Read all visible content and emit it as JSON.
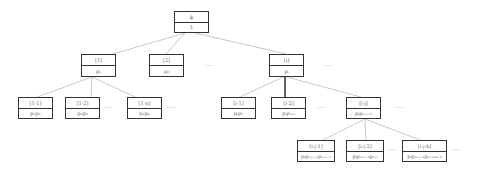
{
  "diagram": {
    "type": "tree",
    "nodes": [
      {
        "id": "root",
        "label": "ϕ",
        "value": "1",
        "x": 174,
        "y": 11,
        "w": 35,
        "h": 22
      },
      {
        "id": "n1",
        "label": "[1]",
        "value": "p₁",
        "x": 81,
        "y": 54,
        "w": 35,
        "h": 23
      },
      {
        "id": "n2",
        "label": "[2]",
        "value": "p₂",
        "x": 149,
        "y": 54,
        "w": 35,
        "h": 23
      },
      {
        "id": "ni",
        "label": "[i]",
        "value": "pᵢ",
        "x": 269,
        "y": 54,
        "w": 35,
        "h": 23
      },
      {
        "id": "n11",
        "label": "[1·1]",
        "value": "p₁p₁",
        "x": 18,
        "y": 97,
        "w": 35,
        "h": 22
      },
      {
        "id": "n12",
        "label": "[1·2]",
        "value": "p₁p₂",
        "x": 65,
        "y": 97,
        "w": 35,
        "h": 22
      },
      {
        "id": "n1n",
        "label": "[1·n]",
        "value": "p₁pₙ",
        "x": 127,
        "y": 97,
        "w": 35,
        "h": 22
      },
      {
        "id": "ni1",
        "label": "[i·1]",
        "value": "pᵢp₁",
        "x": 221,
        "y": 97,
        "w": 35,
        "h": 22
      },
      {
        "id": "ni2",
        "label": "[i·2]",
        "value": "pᵢpᵢ₊₁",
        "x": 271,
        "y": 97,
        "w": 35,
        "h": 22
      },
      {
        "id": "nij",
        "label": "[i·j]",
        "value": "pᵢpᵢ₊ⱼ₋₁",
        "x": 346,
        "y": 97,
        "w": 35,
        "h": 22
      },
      {
        "id": "nij1",
        "label": "[i·j·1]",
        "value": "pᵢpᵢ₊ⱼ₋₁pᵢ₊ⱼ₋₁",
        "x": 297,
        "y": 140,
        "w": 38,
        "h": 22
      },
      {
        "id": "nij2",
        "label": "[i·j·2]",
        "value": "pᵢpᵢ₊ⱼ₋₁pᵢ₊ⱼ",
        "x": 346,
        "y": 140,
        "w": 38,
        "h": 22
      },
      {
        "id": "nijk",
        "label": "[i·j·k]",
        "value": "pᵢpᵢ₊ⱼ₋₁pᵢ₊ⱼ₊ₖ₋₂",
        "x": 402,
        "y": 140,
        "w": 45,
        "h": 22
      }
    ],
    "edges": [
      {
        "from": [
          185,
          33
        ],
        "to": [
          113,
          54
        ],
        "bold": false
      },
      {
        "from": [
          185,
          33
        ],
        "to": [
          166,
          54
        ],
        "bold": false
      },
      {
        "from": [
          195,
          33
        ],
        "to": [
          286,
          54
        ],
        "bold": false
      },
      {
        "from": [
          92,
          77
        ],
        "to": [
          37,
          97
        ],
        "bold": false
      },
      {
        "from": [
          92,
          77
        ],
        "to": [
          91,
          97
        ],
        "bold": false
      },
      {
        "from": [
          92,
          77
        ],
        "to": [
          135,
          97
        ],
        "bold": false
      },
      {
        "from": [
          283,
          77
        ],
        "to": [
          240,
          97
        ],
        "bold": false
      },
      {
        "from": [
          285,
          77
        ],
        "to": [
          285,
          97
        ],
        "bold": true
      },
      {
        "from": [
          287,
          77
        ],
        "to": [
          361,
          97
        ],
        "bold": false
      },
      {
        "from": [
          365,
          119
        ],
        "to": [
          323,
          140
        ],
        "bold": false
      },
      {
        "from": [
          365,
          119
        ],
        "to": [
          366,
          140
        ],
        "bold": false
      },
      {
        "from": [
          365,
          119
        ],
        "to": [
          420,
          140
        ],
        "bold": false
      }
    ],
    "ellipses": [
      {
        "text": "···",
        "x": 205,
        "y": 62
      },
      {
        "text": "···",
        "x": 324,
        "y": 62
      },
      {
        "text": "···",
        "x": 104,
        "y": 104
      },
      {
        "text": "···",
        "x": 167,
        "y": 104
      },
      {
        "text": "···",
        "x": 317,
        "y": 104
      },
      {
        "text": "···",
        "x": 396,
        "y": 104
      },
      {
        "text": "···",
        "x": 388,
        "y": 146
      },
      {
        "text": "···",
        "x": 452,
        "y": 146
      }
    ],
    "colors": {
      "border": "#333333",
      "edge": "#bbbbbb",
      "edge_bold": "#333333",
      "text": "#666666"
    }
  }
}
